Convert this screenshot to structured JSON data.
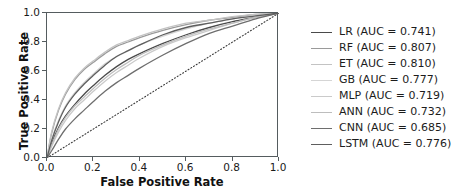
{
  "chart_data": {
    "type": "line",
    "title": "",
    "xlabel": "False Positive Rate",
    "ylabel": "True Positive Rate",
    "xlim": [
      0.0,
      1.0
    ],
    "ylim": [
      0.0,
      1.0
    ],
    "xticks": [
      "0.0",
      "0.2",
      "0.4",
      "0.6",
      "0.8",
      "1.0"
    ],
    "xtick_values": [
      0.0,
      0.2,
      0.4,
      0.6,
      0.8,
      1.0
    ],
    "yticks": [
      "0.0",
      "0.2",
      "0.4",
      "0.6",
      "0.8",
      "1.0"
    ],
    "ytick_values": [
      0.0,
      0.2,
      0.4,
      0.6,
      0.8,
      1.0
    ],
    "grid": false,
    "legend_position": "right",
    "reference_line": {
      "name": "chance-diagonal",
      "style": "dotted",
      "color": "#3a3a3a",
      "x": [
        0.0,
        1.0
      ],
      "y": [
        0.0,
        1.0
      ]
    },
    "x": [
      0.0,
      0.02,
      0.05,
      0.08,
      0.12,
      0.16,
      0.2,
      0.25,
      0.3,
      0.35,
      0.4,
      0.5,
      0.6,
      0.7,
      0.8,
      0.9,
      1.0
    ],
    "series": [
      {
        "name": "LR",
        "auc": 0.741,
        "label": "LR (AUC = 0.741)",
        "color": "#4a4a4a",
        "values": [
          0.0,
          0.1,
          0.21,
          0.29,
          0.37,
          0.44,
          0.5,
          0.57,
          0.63,
          0.68,
          0.72,
          0.79,
          0.85,
          0.9,
          0.94,
          0.97,
          1.0
        ]
      },
      {
        "name": "RF",
        "auc": 0.807,
        "label": "RF (AUC = 0.807)",
        "color": "#9a9a9a",
        "values": [
          0.0,
          0.17,
          0.33,
          0.44,
          0.54,
          0.61,
          0.66,
          0.72,
          0.77,
          0.8,
          0.83,
          0.88,
          0.92,
          0.95,
          0.97,
          0.99,
          1.0
        ]
      },
      {
        "name": "ET",
        "auc": 0.81,
        "label": "ET (AUC = 0.810)",
        "color": "#c3c3c3",
        "values": [
          0.0,
          0.18,
          0.34,
          0.45,
          0.55,
          0.62,
          0.67,
          0.73,
          0.78,
          0.81,
          0.84,
          0.89,
          0.93,
          0.95,
          0.975,
          0.99,
          1.0
        ]
      },
      {
        "name": "GB",
        "auc": 0.777,
        "label": "GB (AUC = 0.777)",
        "color": "#d5d5d5",
        "values": [
          0.0,
          0.13,
          0.26,
          0.36,
          0.45,
          0.52,
          0.58,
          0.65,
          0.7,
          0.74,
          0.78,
          0.84,
          0.89,
          0.93,
          0.96,
          0.98,
          1.0
        ]
      },
      {
        "name": "MLP",
        "auc": 0.719,
        "label": "MLP (AUC = 0.719)",
        "color": "#cacaca",
        "values": [
          0.0,
          0.08,
          0.18,
          0.26,
          0.34,
          0.4,
          0.46,
          0.53,
          0.59,
          0.64,
          0.69,
          0.77,
          0.83,
          0.88,
          0.93,
          0.97,
          1.0
        ]
      },
      {
        "name": "ANN",
        "auc": 0.732,
        "label": "ANN (AUC = 0.732)",
        "color": "#bdbdbd",
        "values": [
          0.0,
          0.09,
          0.2,
          0.28,
          0.36,
          0.42,
          0.48,
          0.55,
          0.61,
          0.66,
          0.71,
          0.78,
          0.84,
          0.89,
          0.93,
          0.97,
          1.0
        ]
      },
      {
        "name": "CNN",
        "auc": 0.685,
        "label": "CNN (AUC = 0.685)",
        "color": "#6e6e6e",
        "values": [
          0.0,
          0.05,
          0.13,
          0.2,
          0.27,
          0.33,
          0.39,
          0.46,
          0.52,
          0.57,
          0.62,
          0.71,
          0.79,
          0.86,
          0.91,
          0.96,
          1.0
        ]
      },
      {
        "name": "LSTM",
        "auc": 0.776,
        "label": "LSTM (AUC = 0.776)",
        "color": "#5e5e5e",
        "values": [
          0.0,
          0.12,
          0.25,
          0.35,
          0.44,
          0.51,
          0.57,
          0.64,
          0.7,
          0.74,
          0.78,
          0.85,
          0.9,
          0.93,
          0.96,
          0.98,
          1.0
        ]
      }
    ]
  }
}
